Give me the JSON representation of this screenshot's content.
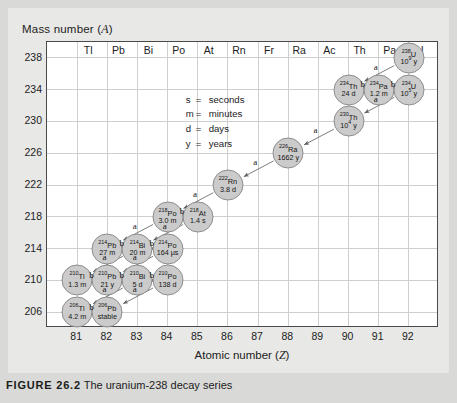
{
  "axes": {
    "y_title": "Mass number (A)",
    "y_title_plain": "Mass number",
    "y_italic": "A",
    "x_title": "Atomic number (Z)",
    "x_italic": "Z",
    "y_ticks": [
      "238",
      "234",
      "230",
      "226",
      "222",
      "218",
      "214",
      "210",
      "206"
    ],
    "x_ticks": [
      "81",
      "82",
      "83",
      "84",
      "85",
      "86",
      "87",
      "88",
      "89",
      "90",
      "91",
      "92"
    ],
    "column_headers": [
      "Tl",
      "Pb",
      "Bi",
      "Po",
      "At",
      "Rn",
      "Fr",
      "Ra",
      "Ac",
      "Th",
      "Pa",
      "U"
    ]
  },
  "legend": {
    "rows": [
      {
        "symbol": "s",
        "eq": "=",
        "meaning": "seconds"
      },
      {
        "symbol": "m",
        "eq": "=",
        "meaning": "minutes"
      },
      {
        "symbol": "d",
        "eq": "=",
        "meaning": "days"
      },
      {
        "symbol": "y",
        "eq": "=",
        "meaning": "years"
      }
    ]
  },
  "caption": {
    "figure_number": "FIGURE 26.2",
    "text": "The uranium-238 decay series"
  },
  "chart_data": {
    "type": "scatter",
    "xlabel": "Atomic number (Z)",
    "ylabel": "Mass number (A)",
    "xlim": [
      80,
      93
    ],
    "ylim": [
      204,
      240
    ],
    "grid": true,
    "legend_position": "center",
    "nuclides": [
      {
        "isotope": "U",
        "mass": 238,
        "z": 92,
        "mass_label": "238",
        "halflife": "10⁹ y",
        "halflife_mantissa": "10",
        "halflife_exponent": "9",
        "halflife_unit": "y"
      },
      {
        "isotope": "Th",
        "mass": 234,
        "z": 90,
        "mass_label": "234",
        "halflife": "24 d"
      },
      {
        "isotope": "Pa",
        "mass": 234,
        "z": 91,
        "mass_label": "234",
        "halflife": "1.2 m"
      },
      {
        "isotope": "U",
        "mass": 234,
        "z": 92,
        "mass_label": "234",
        "halflife": "10⁵ y",
        "halflife_mantissa": "10",
        "halflife_exponent": "5",
        "halflife_unit": "y"
      },
      {
        "isotope": "Th",
        "mass": 230,
        "z": 90,
        "mass_label": "230",
        "halflife": "10⁴ y",
        "halflife_mantissa": "10",
        "halflife_exponent": "4",
        "halflife_unit": "y"
      },
      {
        "isotope": "Ra",
        "mass": 226,
        "z": 88,
        "mass_label": "226",
        "halflife": "1662 y"
      },
      {
        "isotope": "Rn",
        "mass": 222,
        "z": 86,
        "mass_label": "222",
        "halflife": "3.8 d"
      },
      {
        "isotope": "At",
        "mass": 218,
        "z": 85,
        "mass_label": "218",
        "halflife": "1.4 s"
      },
      {
        "isotope": "Po",
        "mass": 218,
        "z": 84,
        "mass_label": "218",
        "halflife": "3.0 m"
      },
      {
        "isotope": "Pb",
        "mass": 214,
        "z": 82,
        "mass_label": "214",
        "halflife": "27 m"
      },
      {
        "isotope": "Bi",
        "mass": 214,
        "z": 83,
        "mass_label": "214",
        "halflife": "20 m"
      },
      {
        "isotope": "Po",
        "mass": 214,
        "z": 84,
        "mass_label": "214",
        "halflife": "164 μs"
      },
      {
        "isotope": "Tl",
        "mass": 210,
        "z": 81,
        "mass_label": "210",
        "halflife": "1.3 m"
      },
      {
        "isotope": "Pb",
        "mass": 210,
        "z": 82,
        "mass_label": "210",
        "halflife": "21 y"
      },
      {
        "isotope": "Bi",
        "mass": 210,
        "z": 83,
        "mass_label": "210",
        "halflife": "5 d"
      },
      {
        "isotope": "Po",
        "mass": 210,
        "z": 84,
        "mass_label": "210",
        "halflife": "138 d"
      },
      {
        "isotope": "Tl",
        "mass": 206,
        "z": 81,
        "mass_label": "206",
        "halflife": "4.2 m"
      },
      {
        "isotope": "Pb",
        "mass": 206,
        "z": 82,
        "mass_label": "206",
        "halflife": "stable"
      }
    ],
    "decays": [
      {
        "from_z": 92,
        "from_a": 238,
        "to_z": 90,
        "to_a": 234,
        "type": "a",
        "label": "a"
      },
      {
        "from_z": 90,
        "from_a": 234,
        "to_z": 91,
        "to_a": 234,
        "type": "b",
        "label": "b"
      },
      {
        "from_z": 91,
        "from_a": 234,
        "to_z": 92,
        "to_a": 234,
        "type": "b",
        "label": "b"
      },
      {
        "from_z": 92,
        "from_a": 234,
        "to_z": 90,
        "to_a": 230,
        "type": "a",
        "label": "a"
      },
      {
        "from_z": 90,
        "from_a": 230,
        "to_z": 88,
        "to_a": 226,
        "type": "a",
        "label": "a"
      },
      {
        "from_z": 88,
        "from_a": 226,
        "to_z": 86,
        "to_a": 222,
        "type": "a",
        "label": "a"
      },
      {
        "from_z": 86,
        "from_a": 222,
        "to_z": 84,
        "to_a": 218,
        "type": "a",
        "label": "a"
      },
      {
        "from_z": 84,
        "from_a": 218,
        "to_z": 85,
        "to_a": 218,
        "type": "b",
        "label": "b"
      },
      {
        "from_z": 85,
        "from_a": 218,
        "to_z": 83,
        "to_a": 214,
        "type": "a",
        "label": "a"
      },
      {
        "from_z": 84,
        "from_a": 218,
        "to_z": 82,
        "to_a": 214,
        "type": "a",
        "label": "a"
      },
      {
        "from_z": 82,
        "from_a": 214,
        "to_z": 83,
        "to_a": 214,
        "type": "b",
        "label": "b"
      },
      {
        "from_z": 83,
        "from_a": 214,
        "to_z": 84,
        "to_a": 214,
        "type": "b",
        "label": "b"
      },
      {
        "from_z": 83,
        "from_a": 214,
        "to_z": 81,
        "to_a": 210,
        "type": "a",
        "label": "a"
      },
      {
        "from_z": 84,
        "from_a": 214,
        "to_z": 82,
        "to_a": 210,
        "type": "a",
        "label": "a"
      },
      {
        "from_z": 81,
        "from_a": 210,
        "to_z": 82,
        "to_a": 210,
        "type": "b",
        "label": "b"
      },
      {
        "from_z": 82,
        "from_a": 210,
        "to_z": 83,
        "to_a": 210,
        "type": "b",
        "label": "b"
      },
      {
        "from_z": 83,
        "from_a": 210,
        "to_z": 84,
        "to_a": 210,
        "type": "b",
        "label": "b"
      },
      {
        "from_z": 83,
        "from_a": 210,
        "to_z": 81,
        "to_a": 206,
        "type": "a",
        "label": "a"
      },
      {
        "from_z": 84,
        "from_a": 210,
        "to_z": 82,
        "to_a": 206,
        "type": "a",
        "label": "a"
      },
      {
        "from_z": 81,
        "from_a": 206,
        "to_z": 82,
        "to_a": 206,
        "type": "b",
        "label": "b"
      }
    ]
  },
  "colors": {
    "page_background": "#d9d9d7",
    "panel_background": "#e8e8e6",
    "plot_background": "#ffffff",
    "frame": "#4a4a4a",
    "gridline": "#cfcfcf",
    "bubble_fill": "#cbcbcb",
    "bubble_stroke": "#8d8d8d",
    "arrow": "#6e6e6e",
    "text": "#141414"
  }
}
